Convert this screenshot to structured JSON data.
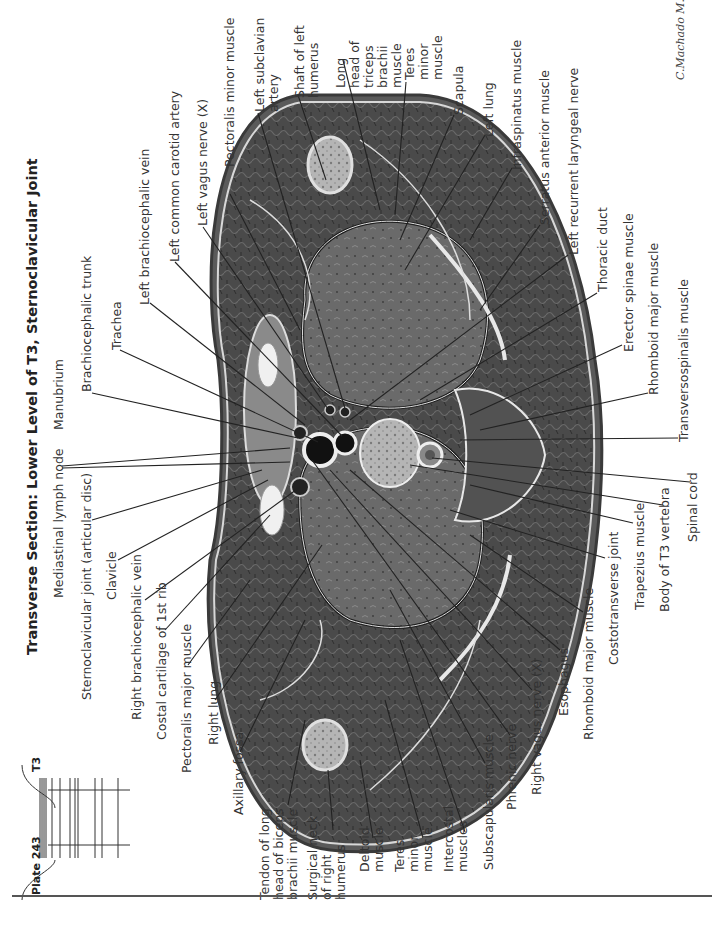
{
  "plate": {
    "number_label": "Plate 243",
    "level_marker": "T3",
    "title": "Transverse Section: Lower Level of T3, Sternoclavicular Joint",
    "signature": "C.Machado M.D."
  },
  "labels_top": [
    "Manubrium",
    "Brachiocephalic trunk",
    "Trachea",
    "Left brachiocephalic vein",
    "Left common carotid artery",
    "Left vagus nerve (X)",
    "Pectoralis minor muscle",
    "Left subclavian\nartery",
    "Shaft of left\nhumerus",
    "Long\nhead of\ntriceps\nbrachii\nmuscle",
    "Teres\nminor\nmuscle",
    "Scapula",
    "Left lung",
    "Infraspinatus muscle",
    "Serratus anterior muscle",
    "Left recurrent laryngeal nerve",
    "Thoracic duct",
    "Erector spinae muscle",
    "Rhomboid major muscle",
    "Transversospinalis muscle"
  ],
  "labels_bottom": [
    "Mediastinal lymph node",
    "Sternoclavicular joint (articular disc)",
    "Clavicle",
    "Right brachiocephalic vein",
    "Costal cartilage of 1st rib",
    "Pectoralis major muscle",
    "Right lung",
    "Axillary fossa",
    "Tendon of long\nhead of biceps\nbrachii muscle",
    "Surgical neck\nof right\nhumerus",
    "Deltoid\nmuscle",
    "Teres\nminor\nmuscle",
    "Intercostal\nmuscles",
    "Subscapularis muscle",
    "Phrenic nerve",
    "Right vagus nerve (X)",
    "Esophagus",
    "Rhomboid major muscle",
    "Costotransverse joint",
    "Trapezius muscle",
    "Body of T3 vertebra",
    "Spinal cord"
  ],
  "colors": {
    "tissue_dark": "#3a3a3a",
    "tissue_mid": "#5e5e5e",
    "lung": "#6b6b6b",
    "bone": "#b8b8b8",
    "fascia": "#e6e6e6",
    "leader": "#222222"
  }
}
